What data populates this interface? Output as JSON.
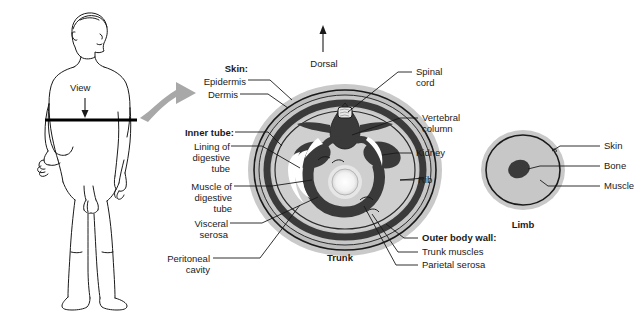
{
  "figure": {
    "title_hidden": "",
    "body_figure": {
      "name": "human-body-outline",
      "view_label": "View",
      "cut_plane": "transverse section line at waist"
    },
    "trunk": {
      "caption": "Trunk",
      "dorsal_label": "Dorsal",
      "left_labels": [
        {
          "id": "skin-heading",
          "text": "Skin:",
          "bold": true
        },
        {
          "id": "epidermis",
          "text": "Epidermis",
          "bold": false
        },
        {
          "id": "dermis",
          "text": "Dermis",
          "bold": false
        },
        {
          "id": "inner-tube-heading",
          "text": "Inner tube:",
          "bold": true
        },
        {
          "id": "lining-of-digestive-tube",
          "text": "Lining of\ndigestive\ntube",
          "bold": false
        },
        {
          "id": "muscle-of-digestive-tube",
          "text": "Muscle of\ndigestive\ntube",
          "bold": false
        },
        {
          "id": "visceral-serosa",
          "text": "Visceral\nserosa",
          "bold": false
        },
        {
          "id": "peritoneal-cavity",
          "text": "Peritoneal\ncavity",
          "bold": false
        }
      ],
      "right_labels": [
        {
          "id": "spinal-cord",
          "text": "Spinal\ncord",
          "bold": false
        },
        {
          "id": "vertebral-column",
          "text": "Vertebral\ncolumn",
          "bold": false
        },
        {
          "id": "kidney",
          "text": "Kidney",
          "bold": false
        },
        {
          "id": "rib",
          "text": "Rib",
          "bold": false
        },
        {
          "id": "outer-body-wall-heading",
          "text": "Outer body wall:",
          "bold": true
        },
        {
          "id": "trunk-muscles",
          "text": "Trunk muscles",
          "bold": false
        },
        {
          "id": "parietal-serosa",
          "text": "Parietal serosa",
          "bold": false
        }
      ]
    },
    "limb": {
      "caption": "Limb",
      "labels": [
        {
          "id": "limb-skin",
          "text": "Skin"
        },
        {
          "id": "limb-bone",
          "text": "Bone"
        },
        {
          "id": "limb-muscle",
          "text": "Muscle"
        }
      ]
    },
    "colors": {
      "background": "#ffffff",
      "ink": "#1a1a1a",
      "outer_halo": "#c9c9c9",
      "body_fill": "#c0c0c0",
      "inner_fill": "#d0d0d0",
      "dark_structure": "#3a3a3a",
      "cavity_white": "#ffffff",
      "arrow_gray": "#a8a8a8"
    }
  }
}
